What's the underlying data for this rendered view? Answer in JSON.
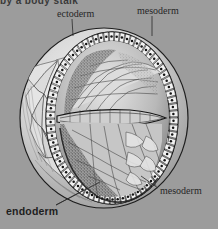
{
  "figure": {
    "kind": "scientific-illustration",
    "background_color": "#9c9c9c",
    "ink_color": "#222222",
    "truncated_caption_text": "by a body stalk",
    "labels": [
      {
        "id": "ectoderm",
        "text": "ectoderm",
        "style": "serif",
        "position": "top-left-center"
      },
      {
        "id": "mesoderm-top",
        "text": "mesoderm",
        "style": "serif",
        "position": "top-right"
      },
      {
        "id": "mesoderm-bottom",
        "text": "mesoderm",
        "style": "serif",
        "position": "bottom-right"
      },
      {
        "id": "endoderm",
        "text": "endoderm",
        "style": "sans-bold",
        "position": "bottom-left"
      }
    ],
    "leader_lines": [
      {
        "from": "ectoderm",
        "x1": 72,
        "y1": 19,
        "x2": 73,
        "y2": 36
      },
      {
        "from": "mesoderm-top",
        "x1": 152,
        "y1": 16,
        "x2": 152,
        "y2": 36
      },
      {
        "from": "mesoderm-bottom",
        "x1": 158,
        "y1": 188,
        "x2": 141,
        "y2": 176
      },
      {
        "from": "endoderm",
        "x1": 56,
        "y1": 205,
        "x2": 100,
        "y2": 182
      },
      {
        "from": "endoderm",
        "x1": 56,
        "y1": 205,
        "x2": 84,
        "y2": 190
      }
    ],
    "structures": [
      "outer ectoderm epithelial cell ring",
      "inner cavity upper chamber",
      "inner cavity lower chamber",
      "horizontal bilaminar embryonic disc",
      "mesoderm stippled layer",
      "endoderm inner cell lining"
    ]
  }
}
